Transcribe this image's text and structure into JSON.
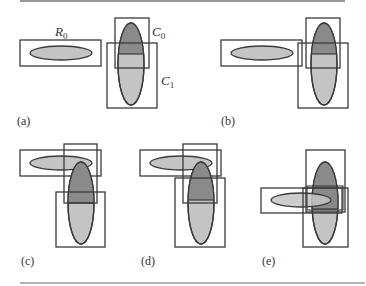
{
  "figure": {
    "rules": {
      "top": {
        "x1": 20,
        "x2": 345,
        "y": 1
      },
      "bottom": {
        "x1": 20,
        "x2": 365,
        "y": 283
      }
    },
    "colors": {
      "stroke": "#3a3a3a",
      "light_fill": "#c4c4c4",
      "dark_fill": "#8a8a8a",
      "rule": "#999999",
      "text": "#333333"
    },
    "annotations": {
      "r0": {
        "base": "R",
        "subscript": "0"
      },
      "c0": {
        "base": "C",
        "subscript": "0"
      },
      "c1": {
        "base": "C",
        "subscript": "1"
      }
    },
    "panels": [
      {
        "id": "a",
        "label": "(a)"
      },
      {
        "id": "b",
        "label": "(b)"
      },
      {
        "id": "c",
        "label": "(c)"
      },
      {
        "id": "d",
        "label": "(d)"
      },
      {
        "id": "e",
        "label": "(e)"
      }
    ]
  }
}
